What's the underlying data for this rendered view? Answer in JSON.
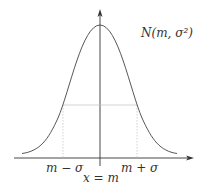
{
  "diagram": {
    "title_label": "N(m, σ²)",
    "labels": {
      "left_sigma": "m − σ",
      "right_sigma": "m + σ",
      "mean": "x = m"
    },
    "colors": {
      "curve": "#444444",
      "axis": "#333333",
      "guide": "#bbbbbb",
      "text": "#333333"
    }
  }
}
